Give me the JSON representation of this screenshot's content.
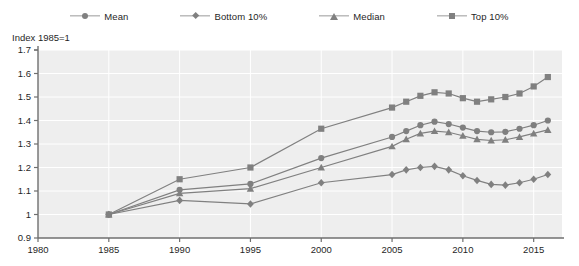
{
  "legend": {
    "position": "top-center",
    "items": [
      {
        "label": "Mean",
        "marker": "circle",
        "color": "#808080",
        "icon": "legend-marker-circle-icon"
      },
      {
        "label": "Bottom 10%",
        "marker": "diamond",
        "color": "#808080",
        "icon": "legend-marker-diamond-icon"
      },
      {
        "label": "Median",
        "marker": "triangle",
        "color": "#808080",
        "icon": "legend-marker-triangle-icon"
      },
      {
        "label": "Top 10%",
        "marker": "square",
        "color": "#808080",
        "icon": "legend-marker-square-icon"
      }
    ]
  },
  "axis_title": "Index 1985=1",
  "colors": {
    "plot_background": "#eeeeee",
    "gridline": "#ffffff",
    "axis": "#6f6f6f",
    "series": "#808080",
    "text": "#1f1f1f",
    "page_background": "#ffffff"
  },
  "chart_data": {
    "type": "line",
    "title": "",
    "subtitle": "",
    "xlabel": "",
    "ylabel": "Index 1985=1",
    "xlim": [
      1980,
      2017
    ],
    "ylim": [
      0.9,
      1.7
    ],
    "ytick_step": 0.1,
    "xtick_step": 5,
    "grid": true,
    "grid_axis": "y",
    "legend_position": "top-center",
    "ytick_labels": [
      "0.9",
      "1",
      "1.1",
      "1.2",
      "1.3",
      "1.4",
      "1.5",
      "1.6",
      "1.7"
    ],
    "ytick_values": [
      0.9,
      1.0,
      1.1,
      1.2,
      1.3,
      1.4,
      1.5,
      1.6,
      1.7
    ],
    "xtick_labels": [
      "1980",
      "1985",
      "1990",
      "1995",
      "2000",
      "2005",
      "2010",
      "2015"
    ],
    "xtick_values": [
      1980,
      1985,
      1990,
      1995,
      2000,
      2005,
      2010,
      2015
    ],
    "series": [
      {
        "name": "Mean",
        "marker": "circle",
        "color": "#808080",
        "x": [
          1985,
          1990,
          1995,
          2000,
          2005,
          2006,
          2007,
          2008,
          2009,
          2010,
          2011,
          2012,
          2013,
          2014,
          2015,
          2016
        ],
        "values": [
          1.0,
          1.105,
          1.13,
          1.24,
          1.33,
          1.355,
          1.38,
          1.395,
          1.385,
          1.37,
          1.355,
          1.35,
          1.352,
          1.365,
          1.38,
          1.4
        ]
      },
      {
        "name": "Bottom 10%",
        "marker": "diamond",
        "color": "#808080",
        "x": [
          1985,
          1990,
          1995,
          2000,
          2005,
          2006,
          2007,
          2008,
          2009,
          2010,
          2011,
          2012,
          2013,
          2014,
          2015,
          2016
        ],
        "values": [
          1.0,
          1.06,
          1.045,
          1.135,
          1.17,
          1.19,
          1.2,
          1.205,
          1.19,
          1.165,
          1.145,
          1.128,
          1.125,
          1.135,
          1.15,
          1.17
        ]
      },
      {
        "name": "Median",
        "marker": "triangle",
        "color": "#808080",
        "x": [
          1985,
          1990,
          1995,
          2000,
          2005,
          2006,
          2007,
          2008,
          2009,
          2010,
          2011,
          2012,
          2013,
          2014,
          2015,
          2016
        ],
        "values": [
          1.0,
          1.09,
          1.11,
          1.2,
          1.29,
          1.32,
          1.345,
          1.355,
          1.35,
          1.335,
          1.32,
          1.315,
          1.318,
          1.33,
          1.345,
          1.36
        ]
      },
      {
        "name": "Top 10%",
        "marker": "square",
        "color": "#808080",
        "x": [
          1985,
          1990,
          1995,
          2000,
          2005,
          2006,
          2007,
          2008,
          2009,
          2010,
          2011,
          2012,
          2013,
          2014,
          2015,
          2016
        ],
        "values": [
          1.0,
          1.15,
          1.2,
          1.365,
          1.455,
          1.48,
          1.505,
          1.52,
          1.515,
          1.495,
          1.48,
          1.49,
          1.5,
          1.515,
          1.545,
          1.585
        ]
      }
    ]
  }
}
